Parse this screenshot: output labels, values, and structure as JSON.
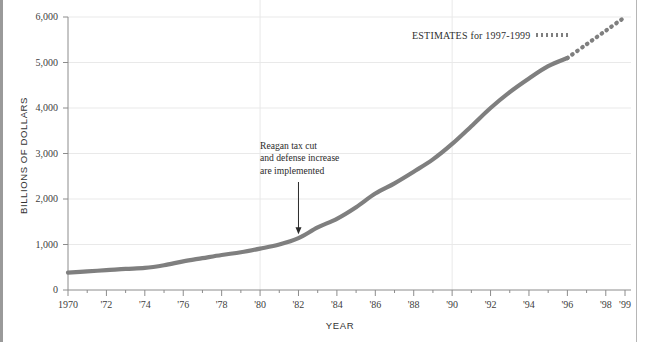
{
  "figure": {
    "cropped_title_fragment": "deficit spending, pushed the public debt up dramatically beginning",
    "background_color": "#ffffff",
    "line_color": "#7f7f7f",
    "grid_color": "#e9e9e9",
    "axis_color": "#8c8c8c"
  },
  "legend": {
    "text": "ESTIMATES for 1997-1999",
    "swatch_name": "dotted-line-swatch"
  },
  "annotation": {
    "text": "Reagan tax cut\nand defense increase\nare implemented",
    "arrow_target_year": 1982
  },
  "chart_data": {
    "type": "line",
    "title": "",
    "xlabel": "YEAR",
    "ylabel": "BILLIONS OF DOLLARS",
    "xlim": [
      1970,
      1999
    ],
    "ylim": [
      0,
      6000
    ],
    "yticks": [
      0,
      1000,
      2000,
      3000,
      4000,
      5000,
      6000
    ],
    "ytick_labels": [
      "0",
      "1,000",
      "2,000",
      "3,000",
      "4,000",
      "5,000",
      "6,000"
    ],
    "xticks": [
      1970,
      1972,
      1974,
      1976,
      1978,
      1980,
      1982,
      1984,
      1986,
      1988,
      1990,
      1992,
      1994,
      1996,
      1998,
      1999
    ],
    "xtick_labels": [
      "1970",
      "'72",
      "'74",
      "'76",
      "'78",
      "'80",
      "'82",
      "'84",
      "'86",
      "'88",
      "'90",
      "'92",
      "'94",
      "'96",
      "'98",
      "'99"
    ],
    "grid": "horizontal gridlines at every 1,000; vertical gridlines at 1980 and 1990",
    "gridlines_x": [
      1980,
      1990
    ],
    "legend_position": "top-right",
    "series": [
      {
        "name": "Public debt (actual)",
        "style": "solid",
        "x": [
          1970,
          1971,
          1972,
          1973,
          1974,
          1975,
          1976,
          1977,
          1978,
          1979,
          1980,
          1981,
          1982,
          1983,
          1984,
          1985,
          1986,
          1987,
          1988,
          1989,
          1990,
          1991,
          1992,
          1993,
          1994,
          1995,
          1996
        ],
        "values": [
          380,
          410,
          435,
          465,
          485,
          545,
          630,
          700,
          770,
          830,
          910,
          1000,
          1140,
          1375,
          1565,
          1820,
          2120,
          2345,
          2600,
          2870,
          3210,
          3600,
          4000,
          4350,
          4650,
          4920,
          5100
        ]
      },
      {
        "name": "Public debt (estimates 1997-1999)",
        "style": "dotted",
        "x": [
          1996,
          1997,
          1998,
          1999
        ],
        "values": [
          5100,
          5400,
          5700,
          6000
        ]
      }
    ]
  }
}
